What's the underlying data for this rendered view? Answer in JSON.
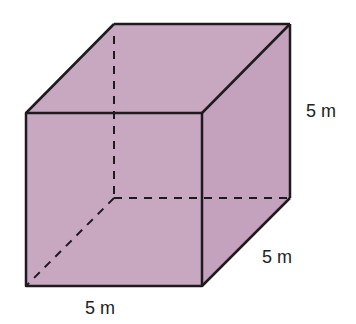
{
  "figure": {
    "type": "cube",
    "fill_color": "#c8a7c1",
    "edge_color": "#1e1a1e",
    "labels": {
      "height": "5 m",
      "depth": "5 m",
      "width": "5 m"
    }
  }
}
